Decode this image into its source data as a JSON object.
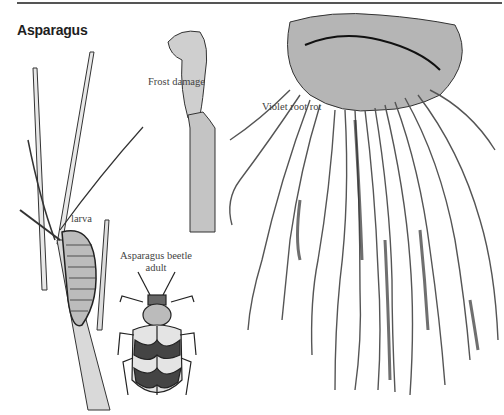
{
  "page": {
    "title": "Asparagus"
  },
  "illustrations": [
    {
      "id": "frost-damage",
      "label": "Frost damage"
    },
    {
      "id": "violet-root-rot",
      "label": "Violet root rot"
    },
    {
      "id": "larva",
      "label": "larva"
    },
    {
      "id": "asparagus-beetle-adult",
      "label_line1": "Asparagus beetle",
      "label_line2": "adult"
    }
  ]
}
